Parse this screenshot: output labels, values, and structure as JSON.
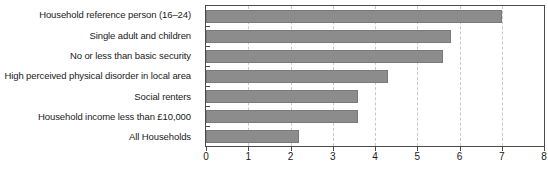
{
  "chart_data": {
    "type": "bar",
    "orientation": "horizontal",
    "title": "",
    "subtitle": "",
    "xlabel": "",
    "ylabel": "",
    "xlim": [
      0,
      8
    ],
    "ylim": null,
    "grid": true,
    "grid_axis": "x",
    "legend": false,
    "legend_position": "none",
    "xticks": [
      0,
      1,
      2,
      3,
      4,
      5,
      6,
      7,
      8
    ],
    "xtick_labels": [
      "0",
      "1",
      "2",
      "3",
      "4",
      "5",
      "6",
      "7",
      "8"
    ],
    "categories": [
      "Household reference person (16–24)",
      "Single adult and children",
      "No or less than basic security",
      "High perceived physical disorder in local area",
      "Social renters",
      "Household income less than £10,000",
      "All Households"
    ],
    "values": [
      7.0,
      5.8,
      5.6,
      4.3,
      3.6,
      3.6,
      2.2
    ],
    "series": [
      {
        "name": "",
        "values": [
          7.0,
          5.8,
          5.6,
          4.3,
          3.6,
          3.6,
          2.2
        ]
      }
    ]
  },
  "style": {
    "bar_fill": "#8c8c8c",
    "bar_stroke": "#7a7a7a",
    "frame_color": "#4a4a4a",
    "gridline_color": "#c8c8c8",
    "text_color": "#1a1a1a",
    "background": "#ffffff"
  }
}
